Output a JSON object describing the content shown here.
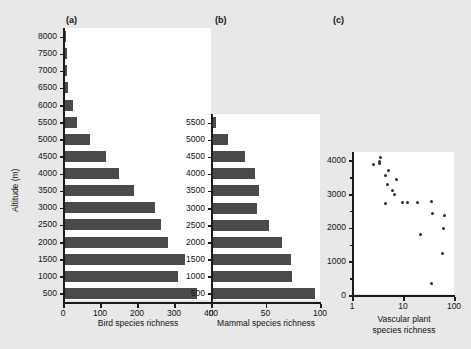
{
  "figure": {
    "background_color": "#e8e8e8",
    "plot_background_color": "#ffffff",
    "bar_color": "#4a4a4a",
    "point_color": "#2b2b2b",
    "axis_color": "#1a1a1a",
    "shared_y_axis_title": "Altitude (m)"
  },
  "panels": {
    "a": {
      "label": "(a)"
    },
    "b": {
      "label": "(b)"
    },
    "c": {
      "label": "(c)"
    }
  },
  "chart_data": [
    {
      "panel": "a",
      "type": "bar",
      "orientation": "horizontal",
      "title": "(a)",
      "xlabel": "Bird species richness",
      "ylabel": "Altitude (m)",
      "xlim": [
        0,
        400
      ],
      "xticks": [
        0,
        100,
        200,
        300,
        400
      ],
      "xtick_labels": [
        "0",
        "100",
        "200",
        "300",
        "400"
      ],
      "grid": false,
      "legend": "none",
      "categories": [
        8000,
        7500,
        7000,
        6500,
        6000,
        5500,
        5000,
        4500,
        4000,
        3500,
        3000,
        2500,
        2000,
        1500,
        1000,
        500
      ],
      "category_labels": [
        "8000",
        "7500",
        "7000",
        "6500",
        "6000",
        "5500",
        "5000",
        "4500",
        "4000",
        "3500",
        "3000",
        "2500",
        "2000",
        "1500",
        "1000",
        "500"
      ],
      "values": [
        4,
        6,
        8,
        10,
        22,
        34,
        68,
        112,
        148,
        188,
        245,
        262,
        280,
        325,
        308,
        358
      ]
    },
    {
      "panel": "b",
      "type": "bar",
      "orientation": "horizontal",
      "title": "(b)",
      "xlabel": "Mammal species richness",
      "ylabel": "Altitude (m)",
      "xlim": [
        0,
        100
      ],
      "xticks": [
        0,
        50,
        100
      ],
      "xtick_labels": [
        "0",
        "50",
        "100"
      ],
      "grid": false,
      "legend": "none",
      "categories": [
        5500,
        5000,
        4500,
        4000,
        3500,
        3000,
        2500,
        2000,
        1500,
        1000,
        500
      ],
      "category_labels": [
        "5500",
        "5000",
        "4500",
        "4000",
        "3500",
        "3000",
        "2500",
        "2000",
        "1500",
        "1000",
        "500"
      ],
      "values": [
        3,
        14,
        30,
        39,
        43,
        41,
        52,
        64,
        72,
        73,
        94
      ]
    },
    {
      "panel": "c",
      "type": "scatter",
      "title": "(c)",
      "xlabel": "Vascular plant\nspecies richness",
      "xlabel_line1": "Vascular plant",
      "xlabel_line2": "species richness",
      "ylabel": "Altitude (m)",
      "xscale": "log",
      "xlim": [
        1,
        100
      ],
      "xticks": [
        1,
        10,
        100
      ],
      "xtick_labels": [
        "1",
        "10",
        "100"
      ],
      "ylim": [
        0,
        4250
      ],
      "yticks": [
        0,
        1000,
        2000,
        3000,
        4000
      ],
      "ytick_labels": [
        "0",
        "1000",
        "2000",
        "3000",
        "4000"
      ],
      "yticks_minor": [
        500,
        1500,
        2500,
        3500
      ],
      "grid": false,
      "legend": "none",
      "points": [
        {
          "x": 2.7,
          "y": 3880
        },
        {
          "x": 3.4,
          "y": 3980
        },
        {
          "x": 3.6,
          "y": 4080
        },
        {
          "x": 3.5,
          "y": 3900
        },
        {
          "x": 5.3,
          "y": 3700
        },
        {
          "x": 4.5,
          "y": 3540
        },
        {
          "x": 7.3,
          "y": 3440
        },
        {
          "x": 5.0,
          "y": 3280
        },
        {
          "x": 6.2,
          "y": 3120
        },
        {
          "x": 6.9,
          "y": 2990
        },
        {
          "x": 4.6,
          "y": 2720
        },
        {
          "x": 9.8,
          "y": 2760
        },
        {
          "x": 12.0,
          "y": 2760
        },
        {
          "x": 19.0,
          "y": 2760
        },
        {
          "x": 36.0,
          "y": 2770
        },
        {
          "x": 38.0,
          "y": 2430
        },
        {
          "x": 65.0,
          "y": 2350
        },
        {
          "x": 22.0,
          "y": 1800
        },
        {
          "x": 62.0,
          "y": 1980
        },
        {
          "x": 60.0,
          "y": 1220
        },
        {
          "x": 37.0,
          "y": 330
        }
      ]
    }
  ]
}
